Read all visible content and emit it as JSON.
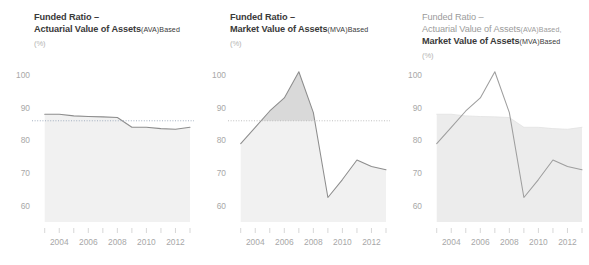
{
  "figure": {
    "background": "#ffffff",
    "width": 589,
    "height": 265
  },
  "panels": [
    {
      "id": "ava",
      "title_line1": "Funded Ratio –",
      "title_line2_main": "Actuarial Value of Assets",
      "title_line2_paren": "(AVA)",
      "title_line2_tail": "Based",
      "title_line2_comma": "",
      "title_line3_main": "",
      "title_line3_paren": "",
      "title_line3_tail": "",
      "unit": "(%)"
    },
    {
      "id": "mva",
      "title_line1": "Funded Ratio –",
      "title_line2_main": "Market Value of Assets",
      "title_line2_paren": "(MVA)",
      "title_line2_tail": "Based",
      "title_line2_comma": "",
      "title_line3_main": "",
      "title_line3_paren": "",
      "title_line3_tail": "",
      "unit": "(%)"
    },
    {
      "id": "combined",
      "title_line1": "Funded Ratio –",
      "title_line2_main": "Actuarial Value of Assets",
      "title_line2_paren": "(AVA)",
      "title_line2_tail": "Based,",
      "title_line2_comma": ",",
      "title_line3_main": "Market Value of Assets",
      "title_line3_paren": "(MVA)",
      "title_line3_tail": "Based",
      "unit": "(%)"
    }
  ],
  "chart_data": [
    {
      "type": "area",
      "panel": "ava",
      "title": "Funded Ratio – Actuarial Value of Assets (AVA) Based",
      "xlabel": "",
      "ylabel": "(%)",
      "ylim": [
        55,
        104
      ],
      "xlim": [
        2002.4,
        2013.0
      ],
      "grid": false,
      "legend": "none",
      "yticks": [
        100,
        90,
        80,
        70,
        60
      ],
      "ytick_labels": [
        "100",
        "90",
        "80",
        "70",
        "60"
      ],
      "xticks": [
        2003,
        2004,
        2005,
        2006,
        2007,
        2008,
        2009,
        2010,
        2011,
        2012,
        2013
      ],
      "xtick_labels": [
        "",
        "2004",
        "",
        "2006",
        "",
        "2008",
        "",
        "2010",
        "",
        "2012",
        ""
      ],
      "reference_line": {
        "value": 86,
        "style": "dotted",
        "color": "#9aa8bb"
      },
      "series": [
        {
          "name": "Actuarial Value of Assets (AVA) Based",
          "color": "#8d8d8d",
          "fill": "#f1f1f1",
          "x": [
            2003,
            2004,
            2005,
            2006,
            2007,
            2008,
            2009,
            2010,
            2011,
            2012,
            2013
          ],
          "values": [
            88,
            88,
            87.5,
            87.3,
            87.2,
            87,
            84,
            84,
            83.6,
            83.4,
            84
          ]
        }
      ]
    },
    {
      "type": "area",
      "panel": "mva",
      "title": "Funded Ratio – Market Value of Assets (MVA) Based",
      "xlabel": "",
      "ylabel": "(%)",
      "ylim": [
        55,
        104
      ],
      "xlim": [
        2002.4,
        2013.0
      ],
      "grid": false,
      "legend": "none",
      "yticks": [
        100,
        90,
        80,
        70,
        60
      ],
      "ytick_labels": [
        "100",
        "90",
        "80",
        "70",
        "60"
      ],
      "xticks": [
        2003,
        2004,
        2005,
        2006,
        2007,
        2008,
        2009,
        2010,
        2011,
        2012,
        2013
      ],
      "xtick_labels": [
        "",
        "2004",
        "",
        "2006",
        "",
        "2008",
        "",
        "2010",
        "",
        "2012",
        ""
      ],
      "reference_line": {
        "value": 86,
        "style": "dotted",
        "color": "#b9b9b9"
      },
      "series": [
        {
          "name": "Market Value of Assets (MVA) Based",
          "color": "#8d8d8d",
          "fill": "#f1f1f1",
          "fill_above": "#d9d9d9",
          "x": [
            2003,
            2004,
            2005,
            2006,
            2007,
            2008,
            2009,
            2010,
            2011,
            2012,
            2013
          ],
          "values": [
            79,
            84,
            89,
            93,
            101,
            88.5,
            62.5,
            68,
            74,
            72,
            71
          ]
        }
      ]
    },
    {
      "type": "area",
      "panel": "combined",
      "title": "Funded Ratio – Actuarial Value of Assets (AVA) Based, Market Value of Assets (MVA) Based",
      "xlabel": "",
      "ylabel": "(%)",
      "ylim": [
        55,
        104
      ],
      "xlim": [
        2002.4,
        2013.0
      ],
      "grid": false,
      "legend": "none",
      "yticks": [
        100,
        90,
        80,
        70,
        60
      ],
      "ytick_labels": [
        "100",
        "90",
        "80",
        "70",
        "60"
      ],
      "xticks": [
        2003,
        2004,
        2005,
        2006,
        2007,
        2008,
        2009,
        2010,
        2011,
        2012,
        2013
      ],
      "xtick_labels": [
        "",
        "2004",
        "",
        "2006",
        "",
        "2008",
        "",
        "2010",
        "",
        "2012",
        ""
      ],
      "reference_line": null,
      "series": [
        {
          "name": "Actuarial Value of Assets (AVA) Based",
          "color": "#e2e2e2",
          "fill": "#ececec",
          "x": [
            2003,
            2004,
            2005,
            2006,
            2007,
            2008,
            2009,
            2010,
            2011,
            2012,
            2013
          ],
          "values": [
            88,
            88,
            87.5,
            87.3,
            87.2,
            87,
            84,
            84,
            83.6,
            83.4,
            84
          ]
        },
        {
          "name": "Market Value of Assets (MVA) Based",
          "color": "#9e9e9e",
          "fill": "none",
          "x": [
            2003,
            2004,
            2005,
            2006,
            2007,
            2008,
            2009,
            2010,
            2011,
            2012,
            2013
          ],
          "values": [
            79,
            84,
            89,
            93,
            101,
            88.5,
            62.5,
            68,
            74,
            72,
            71
          ]
        }
      ]
    }
  ]
}
